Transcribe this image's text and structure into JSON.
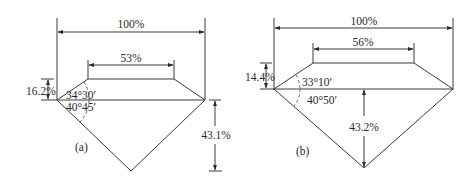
{
  "diagram_a": {
    "label": "(a)",
    "total_width": "100%",
    "table_width": "53%",
    "crown_height": "16.2%",
    "pavilion_depth": "43.1%",
    "crown_angle": "34°30′",
    "pavilion_angle": "40°45′"
  },
  "diagram_b": {
    "label": "(b)",
    "total_width": "100%",
    "table_width": "56%",
    "crown_height": "14.4%",
    "pavilion_depth": "43.2%",
    "crown_angle": "33°10′",
    "pavilion_angle": "40°50′"
  }
}
